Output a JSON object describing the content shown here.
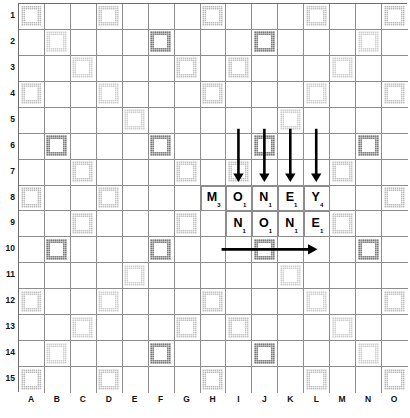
{
  "board": {
    "kind": "scrabble-board",
    "size": 15,
    "column_labels": [
      "A",
      "B",
      "C",
      "D",
      "E",
      "F",
      "G",
      "H",
      "I",
      "J",
      "K",
      "L",
      "M",
      "N",
      "O"
    ],
    "row_labels": [
      "1",
      "2",
      "3",
      "4",
      "5",
      "6",
      "7",
      "8",
      "9",
      "10",
      "11",
      "12",
      "13",
      "14",
      "15"
    ],
    "colors": {
      "triple_word": "#b9b9b9",
      "double_word": "#cfcfcf",
      "triple_letter": "#7c7c7c",
      "double_letter": "#c3c3c3",
      "gridline": "#8d8d8d",
      "border": "#6d6d6d",
      "tile_face": "#ffffff",
      "ink": "#000000"
    },
    "premium_squares": {
      "triple_word": [
        "A1",
        "H1",
        "O1",
        "A8",
        "O8",
        "A15",
        "H15",
        "O15"
      ],
      "double_word": [
        "B2",
        "C3",
        "D4",
        "E5",
        "N2",
        "M3",
        "L4",
        "K5",
        "B14",
        "C13",
        "D12",
        "E11",
        "N14",
        "M13",
        "L12",
        "K11"
      ],
      "triple_letter": [
        "F2",
        "J2",
        "B6",
        "F6",
        "J6",
        "N6",
        "B10",
        "F10",
        "J10",
        "N10",
        "F14",
        "J14"
      ],
      "double_letter": [
        "D1",
        "L1",
        "G3",
        "I3",
        "A4",
        "H4",
        "O4",
        "C7",
        "G7",
        "I7",
        "M7",
        "D8",
        "L8",
        "C9",
        "G9",
        "I9",
        "M9",
        "A12",
        "H12",
        "O12",
        "G13",
        "I13",
        "D15",
        "L15"
      ],
      "center_star": [
        "H8"
      ]
    }
  },
  "tiles": [
    {
      "letter": "M",
      "value": "3",
      "col": "H",
      "row": "8",
      "word": "MONEY"
    },
    {
      "letter": "O",
      "value": "1",
      "col": "I",
      "row": "8",
      "word": "MONEY"
    },
    {
      "letter": "N",
      "value": "1",
      "col": "J",
      "row": "8",
      "word": "MONEY"
    },
    {
      "letter": "E",
      "value": "1",
      "col": "K",
      "row": "8",
      "word": "MONEY"
    },
    {
      "letter": "Y",
      "value": "4",
      "col": "L",
      "row": "8",
      "word": "MONEY"
    },
    {
      "letter": "N",
      "value": "1",
      "col": "I",
      "row": "9",
      "word": "NONE"
    },
    {
      "letter": "O",
      "value": "1",
      "col": "J",
      "row": "9",
      "word": "NONE"
    },
    {
      "letter": "N",
      "value": "1",
      "col": "K",
      "row": "9",
      "word": "NONE"
    },
    {
      "letter": "E",
      "value": "1",
      "col": "L",
      "row": "9",
      "word": "NONE"
    }
  ],
  "annotations": {
    "down_arrows": [
      {
        "name": "down-arrow-I",
        "col": "I",
        "from_row": "6",
        "to_row": "8"
      },
      {
        "name": "down-arrow-J",
        "col": "J",
        "from_row": "6",
        "to_row": "8"
      },
      {
        "name": "down-arrow-K",
        "col": "K",
        "from_row": "6",
        "to_row": "8"
      },
      {
        "name": "down-arrow-L",
        "col": "L",
        "from_row": "6",
        "to_row": "8"
      }
    ],
    "right_arrows": [
      {
        "name": "right-arrow-row-10",
        "row": "10",
        "from_col": "I",
        "to_col": "L"
      }
    ]
  }
}
